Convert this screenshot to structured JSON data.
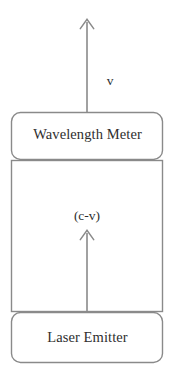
{
  "diagram": {
    "background_color": "#ffffff",
    "stroke_color": "#808080",
    "text_color": "#2e2e2e",
    "boxes": [
      {
        "id": "wavelength-meter",
        "label": "Wavelength Meter",
        "shape": "rounded-rectangle",
        "x": 11,
        "y": 112,
        "width": 152,
        "height": 48,
        "corner_radius": 9
      },
      {
        "id": "beam-path",
        "label": "",
        "shape": "rectangle",
        "x": 11,
        "y": 160,
        "width": 152,
        "height": 152,
        "corner_radius": 0
      },
      {
        "id": "laser-emitter",
        "label": "Laser Emitter",
        "shape": "rounded-rectangle",
        "x": 11,
        "y": 312,
        "width": 152,
        "height": 51,
        "corner_radius": 9
      }
    ],
    "arrows": [
      {
        "id": "outgoing-beam-arrow",
        "label": "v",
        "direction": "up",
        "x": 87,
        "y_tail": 112,
        "y_tip": 19,
        "label_x": 110,
        "label_y": 82
      },
      {
        "id": "incoming-beam-arrow",
        "label": "(c-v)",
        "direction": "up",
        "x": 87,
        "y_tail": 312,
        "y_tip": 230,
        "label_x": 87,
        "label_y": 218
      }
    ]
  },
  "labels": {
    "wavelength_meter": "Wavelength Meter",
    "laser_emitter": "Laser Emitter",
    "velocity": "v",
    "relative_speed": "(c-v)"
  }
}
